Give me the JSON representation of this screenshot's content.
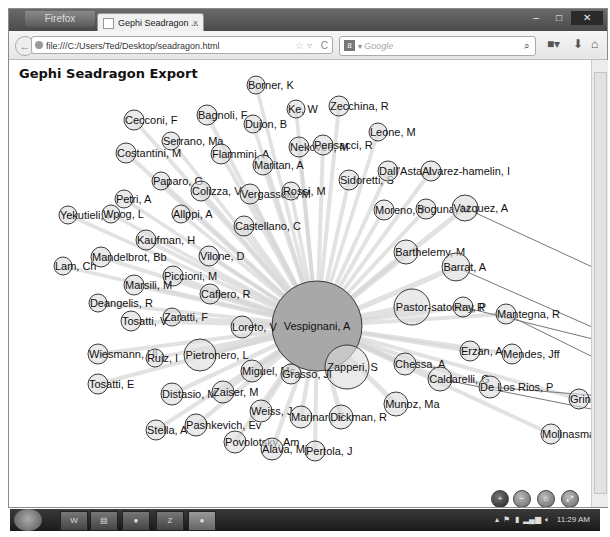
{
  "browser": {
    "app_button": "Firefox",
    "tab_title": "Gephi Seadragon ...",
    "url": "file:///C:/Users/Ted/Desktop/seadragon.html",
    "search_placeholder": "Google",
    "search_engine_icon": "google-icon",
    "window_controls": [
      "minimize",
      "maximize",
      "close"
    ]
  },
  "page": {
    "title": "Gephi Seadragon Export"
  },
  "graph": {
    "center_node": "Vespignani, A",
    "nodes": [
      {
        "label": "Borner, K",
        "x": 255,
        "y": 84,
        "r": 9
      },
      {
        "label": "Ke, W",
        "x": 295,
        "y": 108,
        "r": 9
      },
      {
        "label": "Zecchina, R",
        "x": 338,
        "y": 105,
        "r": 10
      },
      {
        "label": "Cecconi, F",
        "x": 133,
        "y": 119,
        "r": 10
      },
      {
        "label": "Bagnoli, F",
        "x": 206,
        "y": 114,
        "r": 10
      },
      {
        "label": "Dujon, B",
        "x": 252,
        "y": 123,
        "r": 9
      },
      {
        "label": "Serrano, Ma",
        "x": 170,
        "y": 140,
        "r": 9
      },
      {
        "label": "Costantini, M",
        "x": 125,
        "y": 152,
        "r": 10
      },
      {
        "label": "Flammini, A",
        "x": 220,
        "y": 153,
        "r": 10
      },
      {
        "label": "Nekovee, M",
        "x": 298,
        "y": 146,
        "r": 10
      },
      {
        "label": "Pensacci, R",
        "x": 322,
        "y": 144,
        "r": 10
      },
      {
        "label": "Leone, M",
        "x": 377,
        "y": 131,
        "r": 9
      },
      {
        "label": "Maritan, A",
        "x": 262,
        "y": 164,
        "r": 10
      },
      {
        "label": "Paparo, G",
        "x": 160,
        "y": 180,
        "r": 9
      },
      {
        "label": "Colizza, V",
        "x": 200,
        "y": 190,
        "r": 10
      },
      {
        "label": "Vergassola, M",
        "x": 249,
        "y": 193,
        "r": 10
      },
      {
        "label": "Rossi, M",
        "x": 290,
        "y": 190,
        "r": 9
      },
      {
        "label": "Sidoretti, S",
        "x": 348,
        "y": 179,
        "r": 10
      },
      {
        "label": "Dall'Asta, L",
        "x": 387,
        "y": 170,
        "r": 10
      },
      {
        "label": "Alvarez-hamelin, I",
        "x": 430,
        "y": 170,
        "r": 10
      },
      {
        "label": "Petri, A",
        "x": 123,
        "y": 198,
        "r": 9
      },
      {
        "label": "Yekutieli, I",
        "x": 67,
        "y": 214,
        "r": 9
      },
      {
        "label": "Wpog, L",
        "x": 110,
        "y": 213,
        "r": 9
      },
      {
        "label": "Allppi, A",
        "x": 180,
        "y": 213,
        "r": 9
      },
      {
        "label": "Moreno, Y",
        "x": 383,
        "y": 209,
        "r": 10
      },
      {
        "label": "Boguna, M",
        "x": 425,
        "y": 208,
        "r": 10
      },
      {
        "label": "Vazquez, A",
        "x": 464,
        "y": 207,
        "r": 13
      },
      {
        "label": "Castellano, C",
        "x": 243,
        "y": 225,
        "r": 10
      },
      {
        "label": "Kaufman, H",
        "x": 145,
        "y": 239,
        "r": 10
      },
      {
        "label": "Mandelbrot, Bb",
        "x": 100,
        "y": 256,
        "r": 10
      },
      {
        "label": "Lam, Ch",
        "x": 62,
        "y": 265,
        "r": 9
      },
      {
        "label": "Vilone, D",
        "x": 208,
        "y": 255,
        "r": 10
      },
      {
        "label": "Barthelemy, M",
        "x": 405,
        "y": 251,
        "r": 12
      },
      {
        "label": "Barrat, A",
        "x": 455,
        "y": 266,
        "r": 14
      },
      {
        "label": "Piccioni, M",
        "x": 172,
        "y": 275,
        "r": 10
      },
      {
        "label": "Marsili, M",
        "x": 133,
        "y": 284,
        "r": 10
      },
      {
        "label": "Cafiero, R",
        "x": 209,
        "y": 293,
        "r": 10
      },
      {
        "label": "Deangelis, R",
        "x": 97,
        "y": 302,
        "r": 9
      },
      {
        "label": "Pastor-satorras, R",
        "x": 411,
        "y": 306,
        "r": 18
      },
      {
        "label": "Ray, P",
        "x": 462,
        "y": 306,
        "r": 10
      },
      {
        "label": "Mantegna, R",
        "x": 505,
        "y": 313,
        "r": 10
      },
      {
        "label": "Zaratti, F",
        "x": 171,
        "y": 316,
        "r": 9
      },
      {
        "label": "Tosatti, V",
        "x": 130,
        "y": 320,
        "r": 10
      },
      {
        "label": "Loreto, V",
        "x": 241,
        "y": 326,
        "r": 11
      },
      {
        "label": "Wiesmann, Hl",
        "x": 97,
        "y": 353,
        "r": 10
      },
      {
        "label": "Ruiz, I",
        "x": 154,
        "y": 357,
        "r": 9
      },
      {
        "label": "Pietronero, L",
        "x": 199,
        "y": 354,
        "r": 16
      },
      {
        "label": "Erzan, A",
        "x": 469,
        "y": 350,
        "r": 10
      },
      {
        "label": "Mendes, Jff",
        "x": 511,
        "y": 353,
        "r": 10
      },
      {
        "label": "Zapperi, S",
        "x": 346,
        "y": 366,
        "r": 22
      },
      {
        "label": "Chessa, A",
        "x": 404,
        "y": 363,
        "r": 11
      },
      {
        "label": "Miguel, Mc",
        "x": 251,
        "y": 370,
        "r": 11
      },
      {
        "label": "Grasso, Jl",
        "x": 290,
        "y": 373,
        "r": 10
      },
      {
        "label": "Caldarelli, G",
        "x": 439,
        "y": 378,
        "r": 12
      },
      {
        "label": "De Los Rios, P",
        "x": 489,
        "y": 386,
        "r": 11
      },
      {
        "label": "Tosatti, E",
        "x": 97,
        "y": 383,
        "r": 10
      },
      {
        "label": "Distasio, M",
        "x": 171,
        "y": 393,
        "r": 11
      },
      {
        "label": "Zaiser, M",
        "x": 222,
        "y": 391,
        "r": 11
      },
      {
        "label": "Munoz, Ma",
        "x": 395,
        "y": 403,
        "r": 12
      },
      {
        "label": "Weiss, J",
        "x": 260,
        "y": 410,
        "r": 11
      },
      {
        "label": "Marinari, E",
        "x": 300,
        "y": 416,
        "r": 11
      },
      {
        "label": "Dickman, R",
        "x": 340,
        "y": 416,
        "r": 12
      },
      {
        "label": "Grinstein, G",
        "x": 578,
        "y": 398,
        "r": 10
      },
      {
        "label": "Stella, A",
        "x": 155,
        "y": 429,
        "r": 10
      },
      {
        "label": "Pashkevich, Ev",
        "x": 195,
        "y": 424,
        "r": 11
      },
      {
        "label": "Povolotsky, Am",
        "x": 234,
        "y": 441,
        "r": 11
      },
      {
        "label": "Alava, Mj",
        "x": 271,
        "y": 448,
        "r": 11
      },
      {
        "label": "Pertola, J",
        "x": 314,
        "y": 450,
        "r": 10
      },
      {
        "label": "Molinasmata, I",
        "x": 550,
        "y": 433,
        "r": 10
      },
      {
        "label": "Am",
        "x": 600,
        "y": 350,
        "r": 0
      }
    ],
    "center": {
      "x": 316,
      "y": 325,
      "r": 45
    },
    "colors": {
      "center_fill": "#a8a8a8",
      "node_fill": "#dcdcdc",
      "node_stroke": "#3a3a3a",
      "edge": "#d6d6d6",
      "dark_edge": "#777777"
    }
  },
  "seadragon_controls": [
    {
      "name": "zoom-in",
      "glyph": "+"
    },
    {
      "name": "zoom-out",
      "glyph": "−"
    },
    {
      "name": "home",
      "glyph": "⌂"
    },
    {
      "name": "fullscreen",
      "glyph": "⤢"
    }
  ],
  "taskbar": {
    "apps": [
      "word",
      "explorer",
      "chrome",
      "app",
      "firefox"
    ],
    "clock": "11:29 AM"
  }
}
